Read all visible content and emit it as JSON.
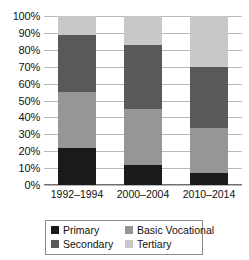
{
  "chart_data": {
    "type": "bar",
    "subtype": "stacked-100-percent",
    "title": "",
    "xlabel": "",
    "ylabel": "",
    "categories": [
      "1992–1994",
      "2000–2004",
      "2010–2014"
    ],
    "series": [
      {
        "name": "Primary",
        "color": "#1a1a1a",
        "values": [
          22,
          12,
          7
        ]
      },
      {
        "name": "Basic Vocational",
        "color": "#969696",
        "values": [
          33,
          33,
          27
        ]
      },
      {
        "name": "Secondary",
        "color": "#595959",
        "values": [
          34,
          38,
          36
        ]
      },
      {
        "name": "Tertiary",
        "color": "#c8c8c8",
        "values": [
          11,
          17,
          30
        ]
      }
    ],
    "stack_order_bottom_to_top": [
      "Primary",
      "Basic Vocational",
      "Secondary",
      "Tertiary"
    ],
    "ylim": [
      0,
      100
    ],
    "ytick_labels": [
      "0%",
      "10%",
      "20%",
      "30%",
      "40%",
      "50%",
      "60%",
      "70%",
      "80%",
      "90%",
      "100%"
    ],
    "ytick_values": [
      0,
      10,
      20,
      30,
      40,
      50,
      60,
      70,
      80,
      90,
      100
    ],
    "grid": true,
    "grid_axis": "y",
    "legend_position": "bottom",
    "legend_entries": [
      {
        "label": "Primary",
        "color": "#1a1a1a"
      },
      {
        "label": "Basic Vocational",
        "color": "#969696"
      },
      {
        "label": "Secondary",
        "color": "#595959"
      },
      {
        "label": "Tertiary",
        "color": "#c8c8c8"
      }
    ]
  },
  "colors": {
    "primary": "#1a1a1a",
    "secondary": "#595959",
    "basic_vocational": "#969696",
    "tertiary": "#c8c8c8",
    "gridline": "#b9b9b9",
    "axis": "#6e6e6e",
    "legend_border": "#8c8c8c",
    "background": "#ffffff",
    "text": "#111111"
  }
}
